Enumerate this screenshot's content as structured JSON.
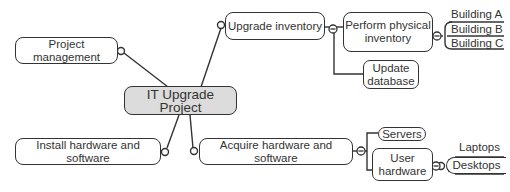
{
  "mindmap": {
    "central": {
      "label": "IT Upgrade Project",
      "fill": "#dcdcdc"
    },
    "branches": [
      {
        "label": "Project management"
      },
      {
        "label": "Upgrade inventory",
        "children": [
          {
            "label": "Perform physical\ninventory",
            "children": [
              {
                "label": "Building A"
              },
              {
                "label": "Building B"
              },
              {
                "label": "Building C"
              }
            ]
          },
          {
            "label": "Update\ndatabase"
          }
        ]
      },
      {
        "label": "Install hardware and software"
      },
      {
        "label": "Acquire hardware and software",
        "children": [
          {
            "label": "Servers"
          },
          {
            "label": "User\nhardware",
            "children": [
              {
                "label": "Laptops"
              },
              {
                "label": "Desktops"
              }
            ]
          }
        ]
      }
    ]
  },
  "colors": {
    "line": "#333333",
    "node_border": "#333333",
    "text": "#333333",
    "background": "#ffffff"
  }
}
